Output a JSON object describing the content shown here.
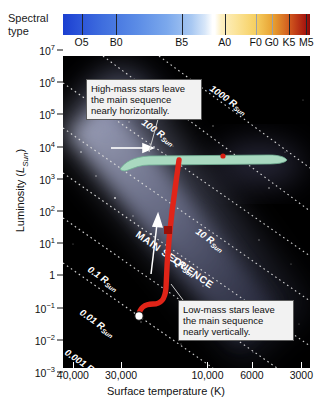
{
  "header": {
    "spectral_label_line1": "Spectral",
    "spectral_label_line2": "type",
    "spectral_classes": [
      {
        "label": "O5",
        "pos": 7.5
      },
      {
        "label": "B0",
        "pos": 21.5
      },
      {
        "label": "B5",
        "pos": 48.0
      },
      {
        "label": "A0",
        "pos": 65.5
      },
      {
        "label": "F0",
        "pos": 78.0
      },
      {
        "label": "G0",
        "pos": 84.5
      },
      {
        "label": "K5",
        "pos": 91.5
      },
      {
        "label": "M5",
        "pos": 98.5
      }
    ]
  },
  "axes": {
    "ylabel_text": "Luminosity (",
    "ylabel_sym": "L",
    "ylabel_sub": "Sun",
    "ylabel_close": ")",
    "xlabel": "Surface temperature (K)",
    "yticks": [
      {
        "mantissa": "10",
        "exp": "7",
        "pos": 0.0
      },
      {
        "mantissa": "10",
        "exp": "6",
        "pos": 10.0
      },
      {
        "mantissa": "10",
        "exp": "5",
        "pos": 20.0
      },
      {
        "mantissa": "10",
        "exp": "4",
        "pos": 30.0
      },
      {
        "mantissa": "10",
        "exp": "3",
        "pos": 40.0
      },
      {
        "mantissa": "10",
        "exp": "2",
        "pos": 50.0
      },
      {
        "mantissa": "10",
        "exp": "1",
        "pos": 60.0
      },
      {
        "mantissa": "1",
        "exp": "",
        "pos": 70.0
      },
      {
        "mantissa": "10",
        "exp": "−1",
        "pos": 80.0
      },
      {
        "mantissa": "10",
        "exp": "−2",
        "pos": 90.0
      },
      {
        "mantissa": "10",
        "exp": "−3",
        "pos": 100.0
      }
    ],
    "xticks": [
      {
        "label": "40,000",
        "pos": 4.0
      },
      {
        "label": "30,000",
        "pos": 23.5
      },
      {
        "label": "10,000",
        "pos": 58.5
      },
      {
        "label": "6000",
        "pos": 76.5
      },
      {
        "label": "3000",
        "pos": 96.5
      }
    ]
  },
  "plot": {
    "main_sequence_label": "MAIN SEQUENCE",
    "radius_lines": [
      {
        "label": "1000 R",
        "sub": "Sun"
      },
      {
        "label": "100 R",
        "sub": "Sun"
      },
      {
        "label": "10 R",
        "sub": "Sun"
      },
      {
        "label": "1 R",
        "sub": "Sun"
      },
      {
        "label": "0.1 R",
        "sub": "Sun"
      },
      {
        "label": "0.01 R",
        "sub": "Sun"
      },
      {
        "label": "0.001 R",
        "sub": "Sun"
      }
    ],
    "track_high_mass_color": "#a9d9c0",
    "track_low_mass_color": "#e02418"
  },
  "callouts": {
    "high_mass": "High-mass stars leave the main sequence nearly horizontally.",
    "low_mass": "Low-mass stars leave the main sequence nearly vertically."
  },
  "chart_data": {
    "type": "scatter",
    "xlabel": "Surface temperature (K)",
    "ylabel": "Luminosity (L_Sun)",
    "xscale": "log-reversed",
    "yscale": "log",
    "xlim": [
      42000,
      2800
    ],
    "ylim": [
      0.001,
      10000000
    ],
    "xtick_values": [
      40000,
      30000,
      10000,
      6000,
      3000
    ],
    "ytick_values": [
      0.001,
      0.01,
      0.1,
      1,
      10,
      100,
      1000,
      10000,
      100000,
      1000000,
      10000000
    ],
    "grid": false,
    "legend": null,
    "spectral_axis": {
      "name": "Spectral type",
      "classes": [
        "O5",
        "B0",
        "B5",
        "A0",
        "F0",
        "G0",
        "K5",
        "M5"
      ]
    },
    "constant_radius_lines": [
      {
        "label": "1000 R_Sun",
        "radius_rsun": 1000
      },
      {
        "label": "100 R_Sun",
        "radius_rsun": 100
      },
      {
        "label": "10 R_Sun",
        "radius_rsun": 10
      },
      {
        "label": "1 R_Sun",
        "radius_rsun": 1
      },
      {
        "label": "0.1 R_Sun",
        "radius_rsun": 0.1
      },
      {
        "label": "0.01 R_Sun",
        "radius_rsun": 0.01
      },
      {
        "label": "0.001 R_Sun",
        "radius_rsun": 0.001
      }
    ],
    "series": [
      {
        "name": "High-mass star evolutionary track",
        "color": "#a9d9c0",
        "start_marker": "main-sequence turnoff",
        "points_temp_lum": [
          [
            25000,
            8000
          ],
          [
            20000,
            8500
          ],
          [
            14000,
            9000
          ],
          [
            10000,
            9200
          ],
          [
            7000,
            9500
          ],
          [
            5000,
            9800
          ],
          [
            3600,
            9000
          ]
        ]
      },
      {
        "name": "Low-mass star evolutionary track",
        "color": "#e02418",
        "start_marker": "open-circle (Sun-like main-sequence position)",
        "points_temp_lum": [
          [
            5800,
            1
          ],
          [
            5400,
            1.1
          ],
          [
            4900,
            3
          ],
          [
            4600,
            30
          ],
          [
            4400,
            200
          ],
          [
            4300,
            900
          ],
          [
            4200,
            2500
          ]
        ]
      }
    ],
    "annotations": [
      {
        "text": "MAIN SEQUENCE",
        "kind": "band-label"
      },
      {
        "text": "High-mass stars leave the main sequence nearly horizontally.",
        "kind": "callout"
      },
      {
        "text": "Low-mass stars leave the main sequence nearly vertically.",
        "kind": "callout"
      }
    ]
  }
}
